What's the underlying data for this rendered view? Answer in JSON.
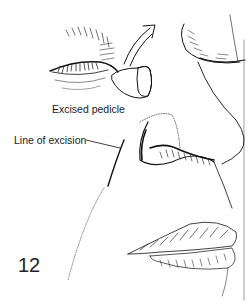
{
  "figure": {
    "number": "12",
    "labels": {
      "excised_pedicle": "Excised pedicle",
      "line_of_excision": "Line of excision"
    },
    "colors": {
      "ink": "#111111",
      "background": "#ffffff"
    }
  }
}
